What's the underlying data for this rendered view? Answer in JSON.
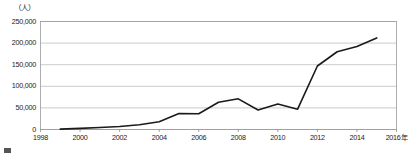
{
  "chart_data": {
    "type": "line",
    "title": "",
    "unit_label": "（人）",
    "xlabel": "",
    "ylabel": "",
    "x_axis_suffix": "年",
    "xlim": [
      1998,
      2016
    ],
    "ylim": [
      0,
      250000
    ],
    "grid": true,
    "legend": "none",
    "y_ticks": [
      "0",
      "50,000",
      "100,000",
      "150,000",
      "200,000",
      "250,000"
    ],
    "y_tick_values": [
      0,
      50000,
      100000,
      150000,
      200000,
      250000
    ],
    "x_ticks": [
      "1998",
      "2000",
      "2002",
      "2004",
      "2006",
      "2008",
      "2010",
      "2012",
      "2014",
      "2016年"
    ],
    "x_tick_values": [
      1998,
      2000,
      2002,
      2004,
      2006,
      2008,
      2010,
      2012,
      2014,
      2016
    ],
    "series": [
      {
        "name": "",
        "color": "#1a1a1a",
        "x": [
          1999,
          2000,
          2001,
          2002,
          2003,
          2004,
          2005,
          2006,
          2007,
          2008,
          2009,
          2010,
          2011,
          2012,
          2013,
          2014,
          2015
        ],
        "values": [
          900,
          2500,
          4500,
          7000,
          11000,
          18000,
          37000,
          36500,
          63000,
          71000,
          45000,
          59000,
          47000,
          147000,
          180000,
          192000,
          212000
        ]
      }
    ]
  },
  "caption": {
    "text": ""
  },
  "colors": {
    "line": "#1a1a1a",
    "grid": "#b4b4b4",
    "axis": "#8c8c8c",
    "background": "#ffffff"
  }
}
